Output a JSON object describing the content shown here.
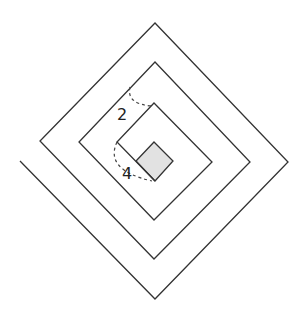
{
  "diagram": {
    "type": "square-spiral",
    "stroke_color": "#333333",
    "fill_color": "#e2e2e2",
    "spiral_points": [
      [
        20,
        161
      ],
      [
        155,
        299
      ],
      [
        288,
        162
      ],
      [
        155,
        23
      ],
      [
        40,
        141
      ],
      [
        154,
        259
      ],
      [
        250,
        162
      ],
      [
        155,
        62
      ],
      [
        79,
        142
      ],
      [
        154,
        220
      ],
      [
        212,
        162
      ],
      [
        154,
        103
      ],
      [
        117,
        142
      ],
      [
        155,
        181
      ]
    ],
    "center_square": {
      "points": [
        [
          154,
          142
        ],
        [
          173,
          161
        ],
        [
          155,
          181
        ],
        [
          136,
          161
        ]
      ]
    },
    "angle_marks": [
      {
        "label": "2",
        "label_pos": [
          122,
          120
        ],
        "arc": "M130,87 Q126,104 152,106"
      },
      {
        "label": "4",
        "label_pos": [
          127,
          179
        ],
        "arc": "M117,142 Q104,170 152,181"
      }
    ]
  }
}
